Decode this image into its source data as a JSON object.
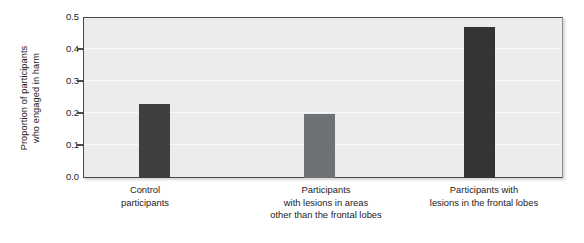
{
  "chart_data": {
    "type": "bar",
    "title": "",
    "xlabel": "",
    "ylabel": "Proportion of participants who engaged in harm",
    "ylabel_lines": [
      "Proportion of participants",
      "who engaged in harm"
    ],
    "categories": [
      "Control participants",
      "Participants with lesions in areas other than the frontal lobes",
      "Participants with lesions in the frontal lobes"
    ],
    "category_lines": [
      [
        "Control",
        "participants"
      ],
      [
        "Participants",
        "with lesions in areas",
        "other than the frontal lobes"
      ],
      [
        "Participants with",
        "lesions in the frontal lobes"
      ]
    ],
    "values": [
      0.23,
      0.2,
      0.47
    ],
    "ylim": [
      0.0,
      0.5
    ],
    "yticks": [
      0.0,
      0.1,
      0.2,
      0.3,
      0.4,
      0.5
    ],
    "ytick_labels": [
      "0.0",
      "0.1",
      "0.2",
      "0.3",
      "0.4",
      "0.5"
    ],
    "grid": true,
    "legend": null,
    "bar_colors": [
      "#3f3f41",
      "#6e7274",
      "#343436"
    ],
    "plot_background": "#ececec",
    "axis_color": "#4a4a4a",
    "gridline_color": "#f9f9f9",
    "page_background": "#ffffff"
  }
}
